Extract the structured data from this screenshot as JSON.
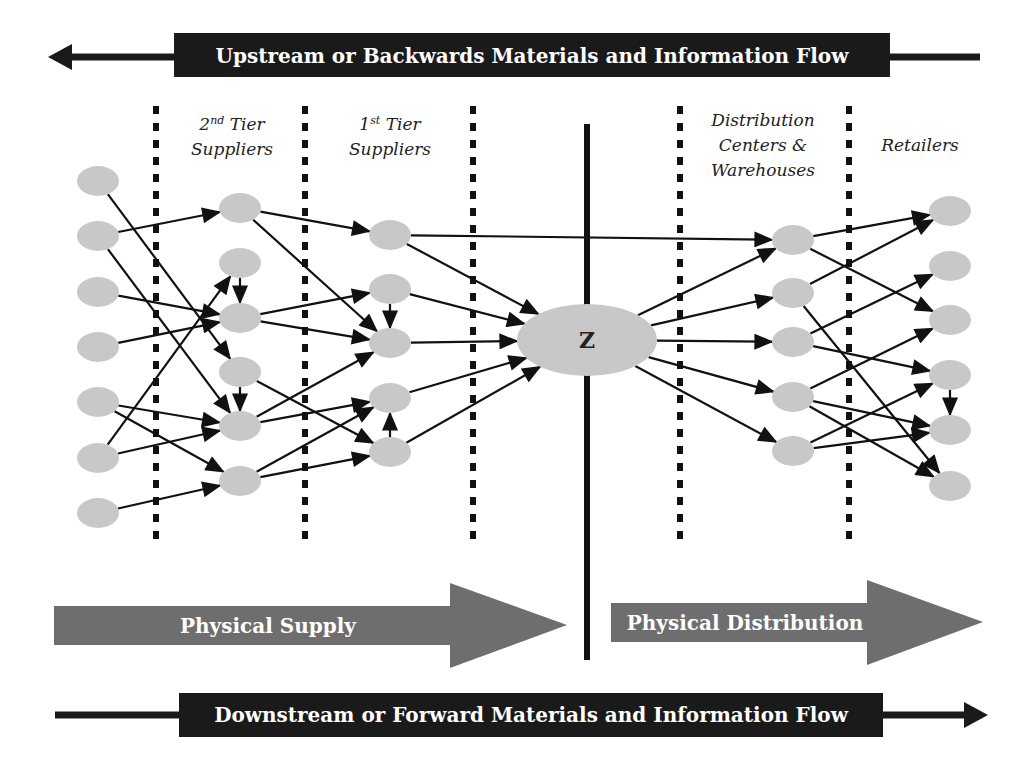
{
  "top_flow": {
    "label": "Upstream or Backwards Materials and Information Flow",
    "direction": "left",
    "bar_color": "#1a1a1a"
  },
  "bottom_flow": {
    "label": "Downstream or Forward Materials and Information Flow",
    "direction": "right",
    "bar_color": "#1a1a1a"
  },
  "columns": {
    "tier2": {
      "line1_num": "2",
      "line1_sup": "nd",
      "line1_rest": " Tier",
      "line2": "Suppliers"
    },
    "tier1": {
      "line1_num": "1",
      "line1_sup": "st",
      "line1_rest": " Tier",
      "line2": "Suppliers"
    },
    "distribution": {
      "line1": "Distribution",
      "line2": "Centers &",
      "line3": "Warehouses"
    },
    "retailers": {
      "line1": "Retailers"
    }
  },
  "focal_node": {
    "label": "Z"
  },
  "phase_arrows": {
    "supply": {
      "label": "Physical Supply",
      "color": "#6e6e6e"
    },
    "distribution": {
      "label": "Physical Distribution",
      "color": "#6e6e6e"
    }
  },
  "colors": {
    "node_fill": "#c8c8c8",
    "edge": "#111111",
    "divider": "#111111"
  },
  "nodes": {
    "A": [
      [
        98,
        181
      ],
      [
        98,
        236
      ],
      [
        98,
        292
      ],
      [
        98,
        347
      ],
      [
        98,
        402
      ],
      [
        98,
        458
      ],
      [
        98,
        513
      ]
    ],
    "B": [
      [
        240,
        208
      ],
      [
        240,
        263
      ],
      [
        240,
        318
      ],
      [
        240,
        372
      ],
      [
        240,
        426
      ],
      [
        240,
        481
      ]
    ],
    "C": [
      [
        390,
        235
      ],
      [
        390,
        289
      ],
      [
        390,
        343
      ],
      [
        390,
        398
      ],
      [
        390,
        452
      ]
    ],
    "D": [
      [
        793,
        240
      ],
      [
        793,
        293
      ],
      [
        793,
        342
      ],
      [
        793,
        397
      ],
      [
        793,
        451
      ]
    ],
    "E": [
      [
        950,
        211
      ],
      [
        950,
        266
      ],
      [
        950,
        320
      ],
      [
        950,
        375
      ],
      [
        950,
        430
      ],
      [
        950,
        486
      ]
    ]
  },
  "edges": [
    [
      "A0",
      "B3"
    ],
    [
      "A1",
      "B0"
    ],
    [
      "A1",
      "B4"
    ],
    [
      "A2",
      "B2"
    ],
    [
      "A3",
      "B2"
    ],
    [
      "A4",
      "B4"
    ],
    [
      "A4",
      "B5"
    ],
    [
      "A5",
      "B1"
    ],
    [
      "A5",
      "B4"
    ],
    [
      "A6",
      "B5"
    ],
    [
      "B1",
      "B2"
    ],
    [
      "B3",
      "B4"
    ],
    [
      "B0",
      "C0"
    ],
    [
      "B0",
      "C2"
    ],
    [
      "B2",
      "C1"
    ],
    [
      "B2",
      "C2"
    ],
    [
      "B3",
      "C4"
    ],
    [
      "B4",
      "C2"
    ],
    [
      "B4",
      "C3"
    ],
    [
      "B5",
      "C3"
    ],
    [
      "B5",
      "C4"
    ],
    [
      "C1",
      "C2"
    ],
    [
      "C4",
      "C3"
    ],
    [
      "C0",
      "Z"
    ],
    [
      "C1",
      "Z"
    ],
    [
      "C2",
      "Z"
    ],
    [
      "C3",
      "Z"
    ],
    [
      "C4",
      "Z"
    ],
    [
      "C0",
      "D0"
    ],
    [
      "Z",
      "D0"
    ],
    [
      "Z",
      "D1"
    ],
    [
      "Z",
      "D2"
    ],
    [
      "Z",
      "D3"
    ],
    [
      "Z",
      "D4"
    ],
    [
      "D0",
      "E0"
    ],
    [
      "D0",
      "E2"
    ],
    [
      "D1",
      "E0"
    ],
    [
      "D1",
      "E5"
    ],
    [
      "D2",
      "E1"
    ],
    [
      "D2",
      "E3"
    ],
    [
      "D3",
      "E2"
    ],
    [
      "D3",
      "E4"
    ],
    [
      "D3",
      "E5"
    ],
    [
      "D4",
      "E3"
    ],
    [
      "D4",
      "E4"
    ],
    [
      "E3",
      "E4"
    ]
  ]
}
